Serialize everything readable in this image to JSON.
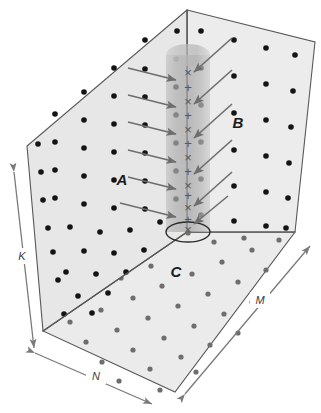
{
  "figure": {
    "background_color": "#ffffff"
  },
  "regions": {
    "wall_a": {
      "label": "A",
      "name": "left-wall",
      "fill": "#e7e7e7",
      "stroke": "#5a5a5a",
      "label_x": 122,
      "label_y": 185,
      "dot_color": "#141414",
      "dot_count": 46
    },
    "wall_b": {
      "label": "B",
      "name": "back-right-wall",
      "fill": "#ececec",
      "stroke": "#5a5a5a",
      "label_x": 238,
      "label_y": 128,
      "dot_color": "#141414",
      "dot_count": 24
    },
    "floor_c": {
      "label": "C",
      "name": "floor",
      "fill": "#ebebeb",
      "stroke": "#5a5a5a",
      "label_x": 176,
      "label_y": 277,
      "dot_color": "#6e6e6e",
      "dot_count": 34
    }
  },
  "cylinder": {
    "name": "central-column",
    "fill": "#b4b4b4",
    "fill_light": "#c9c9c9",
    "stroke": "#4a4a4a",
    "axis_x": 188,
    "top_y": 45,
    "bottom_y": 232,
    "radius_x": 22,
    "radius_y": 10,
    "base_ellipse_stroke": "#2b2b2b",
    "symbols": [
      "×",
      "+",
      "×",
      "+",
      "×",
      "+",
      "×",
      "+",
      "×",
      "+",
      "×",
      "+",
      "×"
    ],
    "symbol_color": "#585858",
    "symbol_start_y": 72,
    "symbol_spacing": 14
  },
  "arrows": {
    "name": "incoming-ray-arrows",
    "color": "#6e6e6e",
    "head_color": "#6e6e6e",
    "from_a": [
      {
        "x1": 128,
        "y1": 68,
        "x2": 176,
        "y2": 80
      },
      {
        "x1": 128,
        "y1": 95,
        "x2": 176,
        "y2": 107
      },
      {
        "x1": 128,
        "y1": 122,
        "x2": 176,
        "y2": 134
      },
      {
        "x1": 128,
        "y1": 150,
        "x2": 176,
        "y2": 162
      },
      {
        "x1": 128,
        "y1": 177,
        "x2": 176,
        "y2": 189
      },
      {
        "x1": 128,
        "y1": 205,
        "x2": 176,
        "y2": 217
      }
    ],
    "from_b": [
      {
        "x1": 232,
        "y1": 38,
        "x2": 192,
        "y2": 72
      },
      {
        "x1": 232,
        "y1": 70,
        "x2": 192,
        "y2": 104
      },
      {
        "x1": 232,
        "y1": 104,
        "x2": 192,
        "y2": 138
      },
      {
        "x1": 232,
        "y1": 140,
        "x2": 192,
        "y2": 174
      },
      {
        "x1": 232,
        "y1": 172,
        "x2": 192,
        "y2": 206
      },
      {
        "x1": 232,
        "y1": 204,
        "x2": 192,
        "y2": 224
      }
    ]
  },
  "dimensions": {
    "k": {
      "label": "K",
      "name": "height-dimension",
      "label_x": 22,
      "label_y": 258,
      "x1": 14,
      "y1": 172,
      "x2": 34,
      "y2": 348
    },
    "n": {
      "label": "N",
      "name": "depth-dimension",
      "label_x": 96,
      "label_y": 380,
      "x1": 35,
      "y1": 353,
      "x2": 152,
      "y2": 404
    },
    "m": {
      "label": "M",
      "name": "width-dimension",
      "label_x": 260,
      "label_y": 303,
      "x1": 185,
      "y1": 394,
      "x2": 310,
      "y2": 246
    }
  }
}
